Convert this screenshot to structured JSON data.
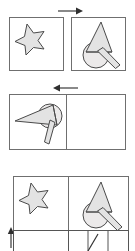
{
  "document": {
    "title": "Geometric shape transformation sequence",
    "background_color": "#ffffff",
    "width": 135,
    "height": 251
  },
  "palette": {
    "panel_border": "#6f6f6f",
    "shape_outline": "#4a4a4a",
    "shape_fill": "#e3e3e3",
    "grid_line": "#555555",
    "grid_diagonal": "#333333",
    "grid_shade": "#e0dedd",
    "arrow": "#2f2f2f"
  },
  "rows": [
    {
      "id": "row-1",
      "label": "Row 1",
      "arrow": {
        "name": "transition-arrow-right",
        "direction": "right",
        "glyph": "→"
      },
      "panels": [
        {
          "id": "panel-1-1",
          "label": "Panel 1",
          "shape": "star",
          "shape_label": "Star"
        },
        {
          "id": "panel-1-2",
          "label": "Panel 2",
          "shape": "cone-with-handle",
          "shape_label": "Cone with handle"
        }
      ]
    },
    {
      "id": "row-2",
      "label": "Row 2",
      "arrow": {
        "name": "transition-arrow-left",
        "direction": "left",
        "glyph": "←"
      },
      "panels": [
        {
          "id": "panel-2-1",
          "label": "Panel 3",
          "shape": "cone-rotated-left",
          "shape_label": "Rotated cone with handle"
        },
        {
          "id": "panel-2-2",
          "label": "Panel 4",
          "shape": "pinwheel-grid",
          "shape_label": "Pinwheel grid pattern",
          "grid": {
            "columns": 4,
            "rows": 4
          }
        }
      ]
    },
    {
      "id": "row-3",
      "label": "Row 3",
      "arrow": {
        "name": "transition-arrow-up",
        "direction": "up",
        "glyph": "↑"
      },
      "panels": [
        {
          "id": "panel-3-1",
          "label": "Panel 5",
          "shape": "star",
          "shape_label": "Star"
        },
        {
          "id": "panel-3-2",
          "label": "Panel 6",
          "shape": "cone-with-handle",
          "shape_label": "Cone with handle"
        }
      ],
      "partial_grid": {
        "id": "partial-grid-bottom",
        "label": "Partial grid row",
        "columns": 4
      }
    }
  ]
}
